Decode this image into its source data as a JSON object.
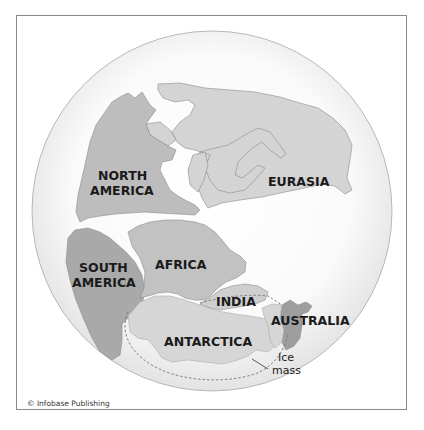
{
  "map": {
    "title": "Pangaea supercontinent",
    "labels": {
      "north_america": [
        "NORTH",
        "AMERICA"
      ],
      "eurasia": "EURASIA",
      "south_america": [
        "SOUTH",
        "AMERICA"
      ],
      "africa": "AFRICA",
      "india": "INDIA",
      "antarctica": "ANTARCTICA",
      "australia": "AUSTRALIA",
      "ice_mass": [
        "Ice",
        "mass"
      ]
    },
    "colors": {
      "globe_edge": "#e6e6e6",
      "globe_center": "#ffffff",
      "north_america": "#bdbdbd",
      "eurasia": "#d4d4d4",
      "south_america": "#a9a9a9",
      "africa": "#c2c2c2",
      "india": "#cfcfcf",
      "antarctica": "#d6d6d6",
      "australia": "#9e9e9e",
      "coastline": "#8c8c8c",
      "dashed_line": "#777777"
    }
  },
  "credit": "© Infobase Publishing"
}
